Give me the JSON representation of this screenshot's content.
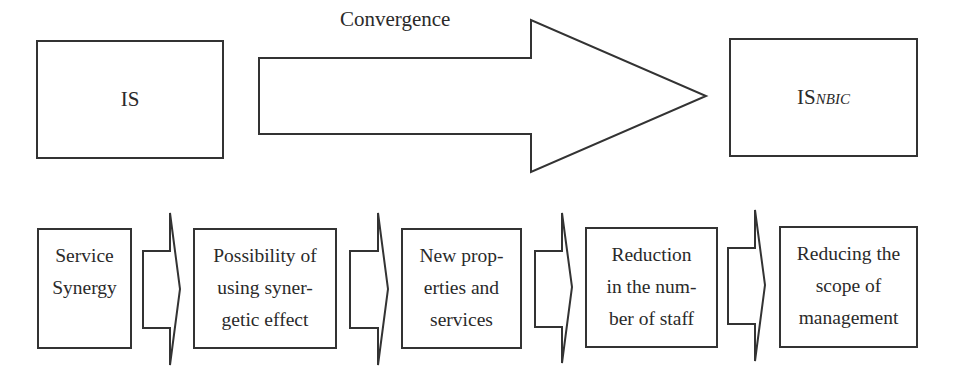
{
  "diagram": {
    "source_box": {
      "label": "IS"
    },
    "target_box": {
      "label": "IS",
      "subscript": "NBIC"
    },
    "main_arrow": {
      "label": "Convergence"
    },
    "steps": [
      {
        "label": "Service Synergy",
        "lines": [
          "Service",
          "Synergy"
        ]
      },
      {
        "label": "Possibility of using synergetic effect",
        "lines": [
          "Possibility of",
          "using syner-",
          "getic effect"
        ]
      },
      {
        "label": "New properties and services",
        "lines": [
          "New prop-",
          "erties and",
          "services"
        ]
      },
      {
        "label": "Reduction in the number of staff",
        "lines": [
          "Reduction",
          "in the num-",
          "ber of staff"
        ]
      },
      {
        "label": "Reducing the scope of management",
        "lines": [
          "Reducing the",
          "scope of",
          "management"
        ]
      }
    ],
    "colors": {
      "stroke": "#333333",
      "fill": "#ffffff",
      "text": "#2a2a2a"
    }
  }
}
